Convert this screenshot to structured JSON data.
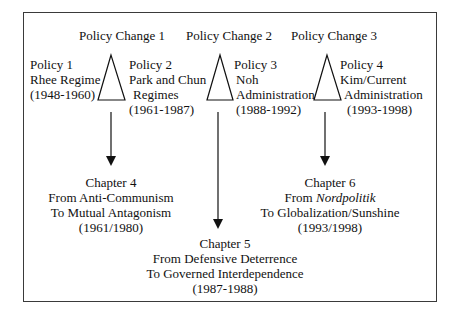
{
  "policy_changes": [
    {
      "label": "Policy Change 1"
    },
    {
      "label": "Policy Change 2"
    },
    {
      "label": "Policy Change 3"
    }
  ],
  "policies": [
    {
      "title": "Policy 1",
      "line2": "Rhee Regime",
      "line3": "(1948-1960)"
    },
    {
      "title": "Policy 2",
      "line2": "Park and Chun",
      "line3": "Regimes",
      "line4": "(1961-1987)"
    },
    {
      "title": "Policy 3",
      "line2": "Noh",
      "line3": "Administration",
      "line4": "(1988-1992)"
    },
    {
      "title": "Policy 4",
      "line2": "Kim/Current",
      "line3": "Administration",
      "line4": "(1993-1998)"
    }
  ],
  "chapters": [
    {
      "title": "Chapter 4",
      "from": "From Anti-Communism",
      "to": "To Mutual Antagonism",
      "years": "(1961/1980)"
    },
    {
      "title": "Chapter 5",
      "from": "From Defensive Deterrence",
      "to": "To Governed Interdependence",
      "years": "(1987-1988)"
    },
    {
      "title": "Chapter 6",
      "from_prefix": "From ",
      "from_term": "Nordpolitik",
      "to": "To Globalization/Sunshine",
      "years": "(1993/1998)"
    }
  ],
  "colors": {
    "stroke": "#111111",
    "frame": "#3a3a3a",
    "background": "#ffffff"
  }
}
